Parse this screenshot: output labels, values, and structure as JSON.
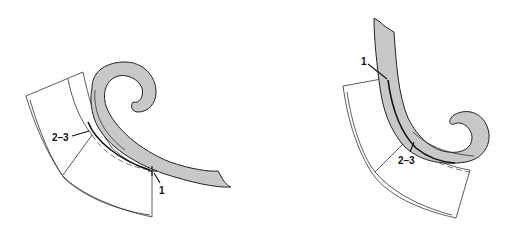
{
  "figures": [
    {
      "id": "left",
      "labels": {
        "point_1": "1",
        "points_2_3": "2–3"
      }
    },
    {
      "id": "right",
      "labels": {
        "point_1": "1",
        "points_2_3": "2–3"
      }
    }
  ],
  "colors": {
    "curve_fill": "#c8c8c8",
    "stroke": "#222222",
    "background": "#ffffff"
  }
}
